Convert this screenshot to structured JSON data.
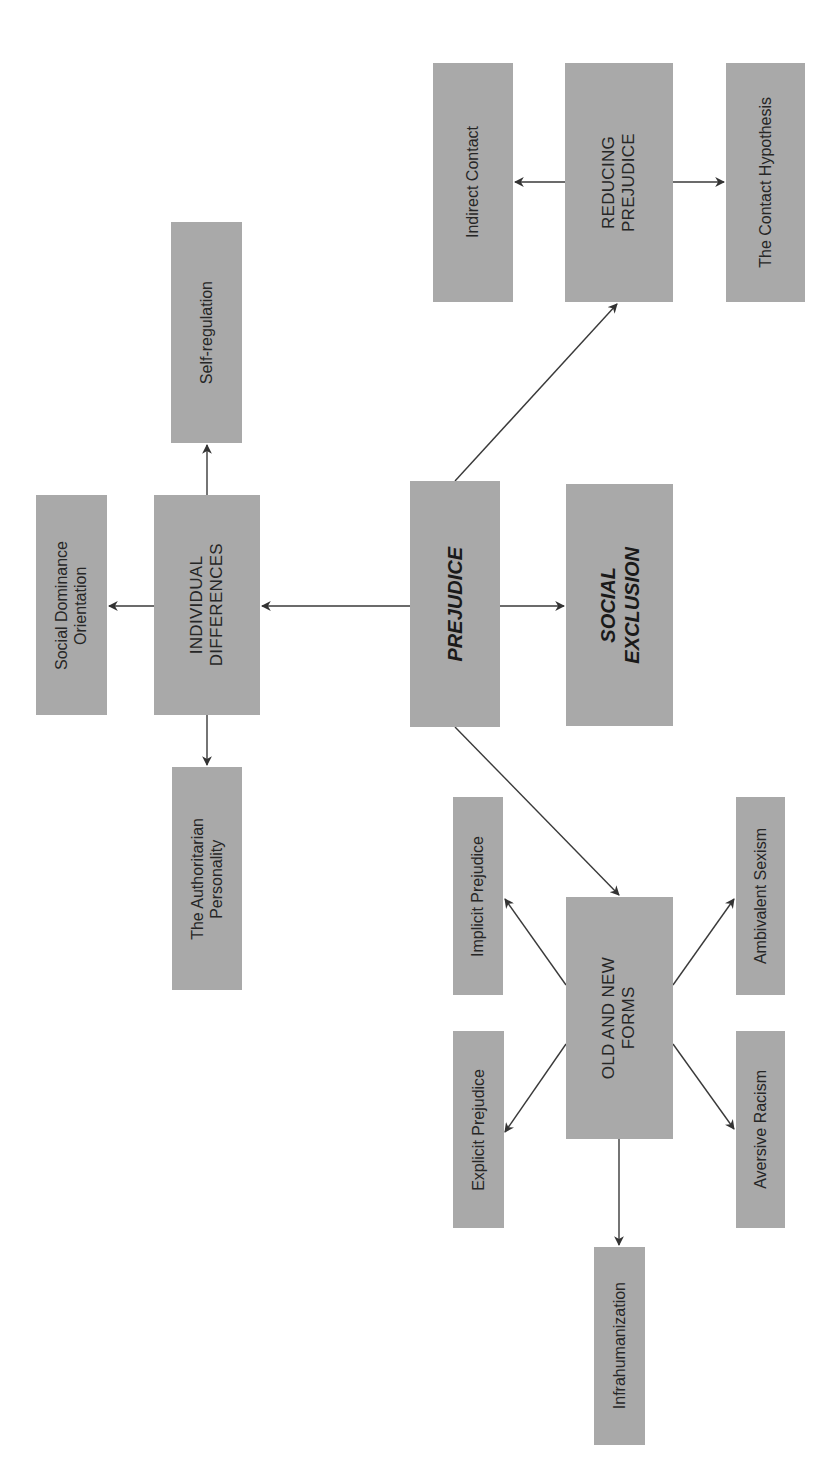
{
  "diagram": {
    "orientation": "rotated-90-ccw",
    "colors": {
      "box_fill": "#a9a9a9",
      "text": "#262626",
      "arrow": "#333333",
      "background": "#ffffff"
    },
    "nodes": {
      "prejudice": {
        "label": "PREJUDICE"
      },
      "social_exclusion": {
        "label": "SOCIAL\nEXCLUSION"
      },
      "individual_differences": {
        "label": "INDIVIDUAL\nDIFFERENCES"
      },
      "self_regulation": {
        "label": "Self-regulation"
      },
      "social_dominance": {
        "label": "Social Dominance\nOrientation"
      },
      "authoritarian": {
        "label": "The Authoritarian\nPersonality"
      },
      "reducing_prejudice": {
        "label": "REDUCING\nPREJUDICE"
      },
      "indirect_contact": {
        "label": "Indirect Contact"
      },
      "contact_hypothesis": {
        "label": "The Contact Hypothesis"
      },
      "old_new_forms": {
        "label": "OLD AND NEW\nFORMS"
      },
      "implicit_prejudice": {
        "label": "Implicit Prejudice"
      },
      "ambivalent_sexism": {
        "label": "Ambivalent Sexism"
      },
      "explicit_prejudice": {
        "label": "Explicit Prejudice"
      },
      "aversive_racism": {
        "label": "Aversive Racism"
      },
      "infrahumanization": {
        "label": "Infrahumanization"
      }
    },
    "edges": [
      {
        "from": "prejudice",
        "to": "individual_differences"
      },
      {
        "from": "prejudice",
        "to": "social_exclusion"
      },
      {
        "from": "prejudice",
        "to": "reducing_prejudice"
      },
      {
        "from": "prejudice",
        "to": "old_new_forms"
      },
      {
        "from": "individual_differences",
        "to": "self_regulation"
      },
      {
        "from": "individual_differences",
        "to": "social_dominance"
      },
      {
        "from": "individual_differences",
        "to": "authoritarian"
      },
      {
        "from": "reducing_prejudice",
        "to": "indirect_contact"
      },
      {
        "from": "reducing_prejudice",
        "to": "contact_hypothesis"
      },
      {
        "from": "old_new_forms",
        "to": "implicit_prejudice"
      },
      {
        "from": "old_new_forms",
        "to": "ambivalent_sexism"
      },
      {
        "from": "old_new_forms",
        "to": "explicit_prejudice"
      },
      {
        "from": "old_new_forms",
        "to": "aversive_racism"
      },
      {
        "from": "old_new_forms",
        "to": "infrahumanization"
      }
    ]
  }
}
